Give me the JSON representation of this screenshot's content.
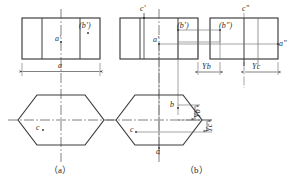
{
  "figure": {
    "background": "#ffffff",
    "line_color": "#3a3a3a",
    "thin_line_color": "#6a6a6a",
    "center_line_color": "#555555",
    "text_color": "#1f1f1f"
  },
  "captions": {
    "a": "（a）",
    "b": "（b）"
  },
  "fig_a": {
    "front_view": {
      "labels": {
        "a_prime": "a'",
        "b_prime": "(b')"
      }
    },
    "dimension": {
      "width_label": "a"
    },
    "top_view": {
      "labels": {
        "c": "c"
      }
    }
  },
  "fig_b": {
    "front_view": {
      "labels": {
        "c_prime": "c'",
        "a_prime": "a'",
        "b_prime": "(b')"
      }
    },
    "side_view": {
      "labels": {
        "c_double_prime": "c\"",
        "b_double_prime": "(b\")",
        "a_double_prime": "a\""
      }
    },
    "top_view": {
      "labels": {
        "b": "b",
        "c": "c",
        "a": "a"
      }
    },
    "dimensions": {
      "yb_horizontal": "Yb",
      "yc_horizontal": "Yc",
      "yb_vertical": "Yb",
      "yc_vertical": "Yc"
    }
  }
}
